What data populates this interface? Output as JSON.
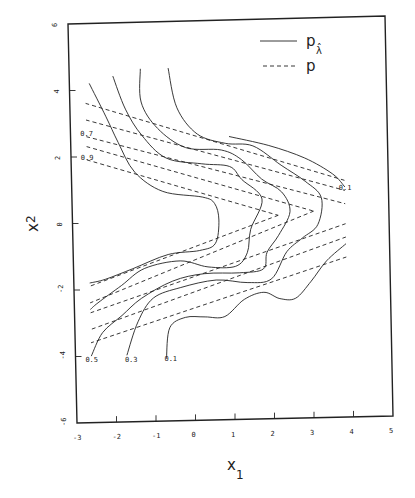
{
  "chart_data": {
    "type": "line",
    "subtype": "contour",
    "title": "",
    "xlabel": "x",
    "xlabel_sub": "1",
    "ylabel": "x",
    "ylabel_sub": "2",
    "xlim": [
      -3,
      5
    ],
    "ylim": [
      -6,
      6
    ],
    "x_ticks": [
      "-3",
      "-2",
      "-1",
      "0",
      "1",
      "2",
      "3",
      "4",
      "5"
    ],
    "y_ticks": [
      "-6",
      "-4",
      "-2",
      "0",
      "2",
      "4",
      "6"
    ],
    "grid": false,
    "legend": {
      "position": "upper right",
      "entries": [
        {
          "label": "p",
          "label_sub": "λ̂",
          "style": "solid"
        },
        {
          "label": "p",
          "label_sub": "",
          "style": "dashed"
        }
      ]
    },
    "contour_levels": [
      "0.1",
      "0.3",
      "0.5",
      "0.7",
      "0.9"
    ],
    "contour_labels": [
      {
        "text": "0.7",
        "x": -2.6,
        "y": 2.7
      },
      {
        "text": "0.9",
        "x": -2.6,
        "y": 2.0
      },
      {
        "text": "0.1",
        "x": 3.9,
        "y": 0.9
      },
      {
        "text": "0.5",
        "x": -2.6,
        "y": -4.1
      },
      {
        "text": "0.3",
        "x": -1.6,
        "y": -4.1
      },
      {
        "text": "0.1",
        "x": -0.6,
        "y": -4.1
      }
    ],
    "series": [
      {
        "name": "p_lambda_hat level 0.9",
        "style": "solid",
        "points": [
          [
            -2.5,
            4.2
          ],
          [
            -2.1,
            3.2
          ],
          [
            -1.8,
            2.4
          ],
          [
            -1.4,
            1.5
          ],
          [
            -0.7,
            0.9
          ],
          [
            0.3,
            0.7
          ],
          [
            0.6,
            0.5
          ],
          [
            0.7,
            0.0
          ],
          [
            0.6,
            -0.7
          ],
          [
            0.2,
            -0.9
          ],
          [
            -0.6,
            -1.0
          ],
          [
            -1.5,
            -1.4
          ],
          [
            -2.2,
            -1.7
          ],
          [
            -2.6,
            -1.8
          ]
        ]
      },
      {
        "name": "p_lambda_hat level 0.7",
        "style": "solid",
        "points": [
          [
            -1.9,
            4.4
          ],
          [
            -1.6,
            3.4
          ],
          [
            -1.2,
            2.6
          ],
          [
            -0.6,
            1.9
          ],
          [
            0.3,
            1.7
          ],
          [
            1.0,
            1.6
          ],
          [
            1.3,
            1.2
          ],
          [
            1.8,
            0.6
          ],
          [
            1.5,
            -0.3
          ],
          [
            1.4,
            -1.0
          ],
          [
            1.1,
            -1.4
          ],
          [
            0.4,
            -1.4
          ],
          [
            -0.3,
            -1.2
          ],
          [
            -1.2,
            -1.4
          ],
          [
            -1.8,
            -1.9
          ],
          [
            -2.4,
            -2.4
          ],
          [
            -2.6,
            -2.6
          ]
        ]
      },
      {
        "name": "p_lambda_hat level 0.5",
        "style": "solid",
        "points": [
          [
            -1.2,
            4.6
          ],
          [
            -1.2,
            3.6
          ],
          [
            -0.8,
            2.8
          ],
          [
            -0.1,
            2.2
          ],
          [
            0.8,
            2.1
          ],
          [
            1.3,
            1.8
          ],
          [
            1.8,
            1.2
          ],
          [
            2.3,
            0.8
          ],
          [
            2.5,
            0.2
          ],
          [
            2.2,
            -0.5
          ],
          [
            1.9,
            -1.0
          ],
          [
            1.8,
            -1.5
          ],
          [
            1.2,
            -1.6
          ],
          [
            0.3,
            -1.6
          ],
          [
            -0.5,
            -1.8
          ],
          [
            -1.3,
            -2.3
          ],
          [
            -1.8,
            -2.8
          ],
          [
            -2.3,
            -3.3
          ],
          [
            -2.6,
            -4.0
          ]
        ]
      },
      {
        "name": "p_lambda_hat level 0.3",
        "style": "solid",
        "points": [
          [
            -0.5,
            4.6
          ],
          [
            -0.3,
            3.4
          ],
          [
            0.2,
            2.6
          ],
          [
            0.9,
            2.3
          ],
          [
            1.6,
            2.2
          ],
          [
            2.3,
            1.6
          ],
          [
            2.9,
            1.1
          ],
          [
            3.3,
            0.6
          ],
          [
            3.2,
            -0.2
          ],
          [
            2.8,
            -0.6
          ],
          [
            2.4,
            -1.0
          ],
          [
            2.0,
            -1.8
          ],
          [
            1.4,
            -1.9
          ],
          [
            0.6,
            -1.8
          ],
          [
            -0.3,
            -2.0
          ],
          [
            -1.0,
            -2.3
          ],
          [
            -1.4,
            -3.0
          ],
          [
            -1.7,
            -4.0
          ]
        ]
      },
      {
        "name": "p_lambda_hat level 0.1",
        "style": "solid",
        "points": [
          [
            1.0,
            2.5
          ],
          [
            2.0,
            2.2
          ],
          [
            2.9,
            1.8
          ],
          [
            3.6,
            1.3
          ],
          [
            3.9,
            0.9
          ]
        ]
      },
      {
        "name": "p_lambda_hat level 0.1 lower",
        "style": "solid",
        "points": [
          [
            3.9,
            -0.8
          ],
          [
            3.4,
            -1.3
          ],
          [
            3.0,
            -1.9
          ],
          [
            2.6,
            -2.4
          ],
          [
            2.2,
            -2.4
          ],
          [
            1.8,
            -2.2
          ],
          [
            1.3,
            -2.4
          ],
          [
            0.8,
            -2.9
          ],
          [
            0.3,
            -2.9
          ],
          [
            -0.2,
            -2.9
          ],
          [
            -0.6,
            -3.2
          ],
          [
            -0.7,
            -4.1
          ]
        ]
      },
      {
        "name": "p level 0.1",
        "style": "dashed",
        "points": [
          [
            -2.6,
            3.6
          ],
          [
            3.9,
            1.1
          ]
        ]
      },
      {
        "name": "p level 0.3",
        "style": "dashed",
        "points": [
          [
            -2.6,
            3.1
          ],
          [
            3.9,
            0.8
          ]
        ]
      },
      {
        "name": "p level 0.5",
        "style": "dashed",
        "points": [
          [
            -2.6,
            2.6
          ],
          [
            3.9,
            0.4
          ]
        ]
      },
      {
        "name": "p level 0.7",
        "style": "dashed",
        "points": [
          [
            -2.6,
            2.3
          ],
          [
            3.1,
            0.2
          ]
        ]
      },
      {
        "name": "p level 0.9",
        "style": "dashed",
        "points": [
          [
            -2.6,
            1.9
          ],
          [
            2.2,
            0.1
          ]
        ]
      },
      {
        "name": "p level 0.9 lower",
        "style": "dashed",
        "points": [
          [
            2.2,
            0.1
          ],
          [
            -2.6,
            -1.9
          ]
        ]
      },
      {
        "name": "p level 0.7 lower",
        "style": "dashed",
        "points": [
          [
            3.1,
            0.2
          ],
          [
            -2.6,
            -2.4
          ]
        ]
      },
      {
        "name": "p level 0.5 lower",
        "style": "dashed",
        "points": [
          [
            3.9,
            -0.2
          ],
          [
            -2.6,
            -2.7
          ]
        ]
      },
      {
        "name": "p level 0.3 lower",
        "style": "dashed",
        "points": [
          [
            3.9,
            -0.6
          ],
          [
            -2.6,
            -3.2
          ]
        ]
      },
      {
        "name": "p level 0.1 lower",
        "style": "dashed",
        "points": [
          [
            3.9,
            -1.2
          ],
          [
            -2.6,
            -3.6
          ]
        ]
      }
    ]
  },
  "labels": {
    "x_axis_title": "x",
    "x_axis_sub": "1",
    "y_axis_title": "x",
    "y_axis_sub": "2",
    "legend_solid_label": "p",
    "legend_solid_sub": "λ̂",
    "legend_dashed_label": "p"
  }
}
